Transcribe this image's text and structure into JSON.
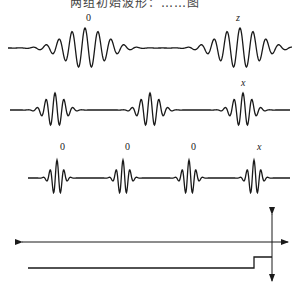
{
  "header": {
    "text": "两组初始波形：……图"
  },
  "rows": [
    {
      "id": "row-1",
      "baseline_y": 48,
      "packets": [
        {
          "center_x": 85,
          "amplitude": 20,
          "wavelength": 13,
          "halfwidth": 45,
          "label": "0",
          "label_x": 86,
          "label_y": 21
        },
        {
          "center_x": 240,
          "amplitude": 20,
          "wavelength": 13,
          "halfwidth": 45,
          "label": "z",
          "label_x": 236,
          "label_y": 21
        }
      ],
      "x_start": 8,
      "x_end": 292
    },
    {
      "id": "row-2",
      "baseline_y": 110,
      "packets": [
        {
          "center_x": 55,
          "amplitude": 17,
          "wavelength": 9,
          "halfwidth": 20,
          "label": "",
          "label_x": 0,
          "label_y": 0
        },
        {
          "center_x": 150,
          "amplitude": 17,
          "wavelength": 9,
          "halfwidth": 20,
          "label": "",
          "label_x": 0,
          "label_y": 0
        },
        {
          "center_x": 243,
          "amplitude": 17,
          "wavelength": 9,
          "halfwidth": 20,
          "label": "x",
          "label_x": 241,
          "label_y": 86
        }
      ],
      "x_start": 10,
      "x_end": 290
    },
    {
      "id": "row-3",
      "baseline_y": 178,
      "packets": [
        {
          "center_x": 57,
          "amplitude": 18,
          "wavelength": 7,
          "halfwidth": 12,
          "label": "0",
          "label_x": 60,
          "label_y": 150
        },
        {
          "center_x": 123,
          "amplitude": 18,
          "wavelength": 7,
          "halfwidth": 12,
          "label": "0",
          "label_x": 125,
          "label_y": 150
        },
        {
          "center_x": 189,
          "amplitude": 18,
          "wavelength": 7,
          "halfwidth": 12,
          "label": "0",
          "label_x": 191,
          "label_y": 150
        },
        {
          "center_x": 254,
          "amplitude": 18,
          "wavelength": 7,
          "halfwidth": 12,
          "label": "x",
          "label_x": 257,
          "label_y": 150
        }
      ],
      "x_start": 28,
      "x_end": 290
    }
  ],
  "axes_diagram": {
    "horizontal_axis": {
      "y": 242,
      "x_start": 22,
      "x_end": 288
    },
    "vertical_axis": {
      "x": 272,
      "y_start": 214,
      "y_end": 281
    },
    "step_line": {
      "low_y": 268,
      "high_y": 257,
      "x_start": 28,
      "step_x": 254,
      "x_end": 272
    }
  },
  "colors": {
    "stroke": "#1a1a1a",
    "background": "#ffffff"
  }
}
